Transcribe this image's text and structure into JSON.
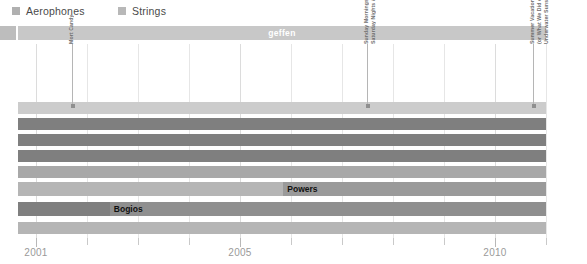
{
  "legend": {
    "items": [
      {
        "label": "Aerophones",
        "color": "#b0b0b0",
        "x": 12
      },
      {
        "label": "Strings",
        "color": "#b8b8b8",
        "x": 118
      }
    ]
  },
  "top_band": {
    "label": "geffen",
    "color": "#c8c8c8",
    "stub_color": "#bdbdbd"
  },
  "annotations": [
    {
      "x": 72,
      "lines": [
        "Mort Candy"
      ]
    },
    {
      "x": 367,
      "lines": [
        "Saturday Nights &",
        "Sunday Mornings"
      ]
    },
    {
      "x": 533,
      "lines": [
        "Underwater Sunshine",
        "(or What We Did on Our",
        "Summer Vacation)"
      ]
    }
  ],
  "chart_data": {
    "type": "bar",
    "orientation": "horizontal",
    "title": "",
    "xlabel": "",
    "ylabel": "",
    "xlim": [
      2000.65,
      2011.0
    ],
    "tick_labels": [
      "2001",
      "2005",
      "2010"
    ],
    "tick_label_values": [
      2001,
      2005,
      2010
    ],
    "gridline_values": [
      2001,
      2002,
      2003,
      2004,
      2005,
      2006,
      2007,
      2008,
      2009,
      2010,
      2011
    ],
    "grid": true,
    "legend_position": "top-left",
    "colors": {
      "light": "#c9c9c9",
      "mid": "#a8a8a8",
      "dark": "#7f7f7f",
      "band": "#c8c8c8"
    },
    "rows": [
      {
        "index": 0,
        "top": 58,
        "height": 12,
        "segments": [
          {
            "start": 2000.65,
            "end": 2011.0,
            "color": "#cccccc",
            "label": ""
          }
        ]
      },
      {
        "index": 1,
        "top": 74,
        "height": 12,
        "segments": [
          {
            "start": 2000.65,
            "end": 2011.0,
            "color": "#7f7f7f",
            "label": ""
          }
        ]
      },
      {
        "index": 2,
        "top": 90,
        "height": 12,
        "segments": [
          {
            "start": 2000.65,
            "end": 2011.0,
            "color": "#7f7f7f",
            "label": ""
          }
        ]
      },
      {
        "index": 3,
        "top": 106,
        "height": 12,
        "segments": [
          {
            "start": 2000.65,
            "end": 2011.0,
            "color": "#7f7f7f",
            "label": ""
          }
        ]
      },
      {
        "index": 4,
        "top": 122,
        "height": 12,
        "segments": [
          {
            "start": 2000.65,
            "end": 2011.0,
            "color": "#a8a8a8",
            "label": ""
          }
        ]
      },
      {
        "index": 5,
        "top": 138,
        "height": 14,
        "segments": [
          {
            "start": 2000.65,
            "end": 2005.85,
            "color": "#b5b5b5",
            "label": ""
          },
          {
            "start": 2005.85,
            "end": 2011.0,
            "color": "#9a9a9a",
            "label": "Powers"
          }
        ]
      },
      {
        "index": 6,
        "top": 158,
        "height": 14,
        "segments": [
          {
            "start": 2000.65,
            "end": 2002.45,
            "color": "#7f7f7f",
            "label": ""
          },
          {
            "start": 2002.45,
            "end": 2011.0,
            "color": "#8f8f8f",
            "label": "Bogios"
          }
        ]
      },
      {
        "index": 7,
        "top": 178,
        "height": 12,
        "segments": [
          {
            "start": 2000.65,
            "end": 2011.0,
            "color": "#b5b5b5",
            "label": ""
          }
        ]
      }
    ]
  }
}
